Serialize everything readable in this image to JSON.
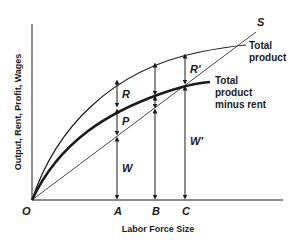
{
  "diagram": {
    "type": "economics-production-curves",
    "axes": {
      "x_label": "Labor Force Size",
      "y_label": "Output, Rent, Profit, Wages",
      "origin_label": "O",
      "x_ticks": [
        "A",
        "B",
        "C"
      ]
    },
    "curves": [
      {
        "id": "total-product",
        "label_line1": "Total",
        "label_line2": "product"
      },
      {
        "id": "total-product-minus-rent",
        "label_line1": "Total",
        "label_line2": "product",
        "label_line3": "minus rent"
      },
      {
        "id": "supply-line",
        "label": "S"
      }
    ],
    "segment_labels": {
      "R": "R",
      "P": "P",
      "W": "W",
      "R_prime": "R'",
      "W_prime": "W'"
    },
    "colors": {
      "line": "#1a1a1a",
      "background": "#ffffff"
    }
  }
}
